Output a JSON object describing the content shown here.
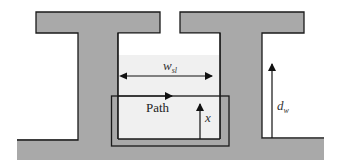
{
  "diagram": {
    "type": "cross-section",
    "labels": {
      "slot_width": "w",
      "slot_width_sub": "sl",
      "path": "Path",
      "height_x": "x",
      "wall_depth": "d",
      "wall_depth_sub": "w"
    },
    "colors": {
      "wall_fill": "#a9a9a9",
      "slot_fill": "#f0f0f0",
      "outline": "#1a1a1a",
      "background": "#ffffff"
    },
    "elements": [
      {
        "name": "left-t-wall",
        "kind": "T-shape"
      },
      {
        "name": "right-t-wall",
        "kind": "T-shape"
      },
      {
        "name": "base",
        "kind": "ground"
      },
      {
        "name": "slot-region",
        "kind": "gap"
      },
      {
        "name": "path-box",
        "kind": "rectangle"
      },
      {
        "name": "slot-width-arrow",
        "kind": "double-arrow",
        "label": "w_sl"
      },
      {
        "name": "path-arrow",
        "kind": "arrow",
        "label": "Path"
      },
      {
        "name": "x-arrow",
        "kind": "arrow",
        "label": "x"
      },
      {
        "name": "dw-arrow",
        "kind": "arrow",
        "label": "d_w"
      }
    ]
  }
}
